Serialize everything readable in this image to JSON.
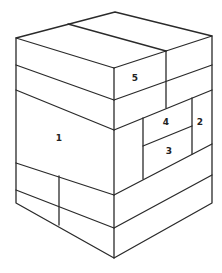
{
  "diagram": {
    "type": "isometric block stack",
    "background": "#ffffff",
    "line_color": "#2a2a2a",
    "labels": [
      {
        "id": "1",
        "text": "1",
        "x": 59,
        "y": 138
      },
      {
        "id": "2",
        "text": "2",
        "x": 200,
        "y": 122
      },
      {
        "id": "3",
        "text": "3",
        "x": 169,
        "y": 151
      },
      {
        "id": "4",
        "text": "4",
        "x": 166,
        "y": 122
      },
      {
        "id": "5",
        "text": "5",
        "x": 135,
        "y": 78
      }
    ]
  }
}
